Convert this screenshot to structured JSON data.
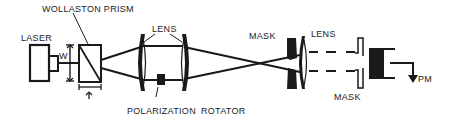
{
  "diagram": {
    "type": "optical-setup-schematic",
    "colors": {
      "ink": "#1a1a1a",
      "background": "#ffffff"
    },
    "labels": {
      "laser": "LASER",
      "wollaston_prism": "WOLLASTON  PRISM",
      "beam_width": "W",
      "lens_1": "LENS",
      "polarization": "POLARIZATION",
      "rotator": "ROTATOR",
      "mask_1": "MASK",
      "lens_2": "LENS",
      "mask_2": "MASK",
      "detector": "PM",
      "prism_thickness": "t"
    },
    "components": [
      "laser",
      "wollaston-prism",
      "lens-pair",
      "polarization-rotator",
      "mask",
      "lens",
      "mask",
      "photomultiplier"
    ]
  }
}
